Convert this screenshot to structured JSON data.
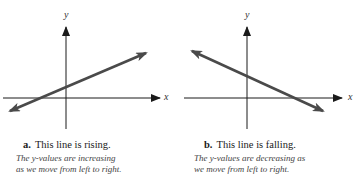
{
  "panels": [
    {
      "letter": "a.",
      "title": "This line is rising.",
      "description_line1": "The y-values are increasing",
      "description_line2": "as we move from left to right.",
      "x_axis_label": "x",
      "y_axis_label": "y",
      "line_direction": "rising"
    },
    {
      "letter": "b.",
      "title": "This line is falling.",
      "description_line1": "The y-values are decreasing as",
      "description_line2": "we move from left to right.",
      "x_axis_label": "x",
      "y_axis_label": "y",
      "line_direction": "falling"
    }
  ],
  "colors": {
    "axis": "#1a1a1a",
    "line": "#4a4a4a"
  }
}
